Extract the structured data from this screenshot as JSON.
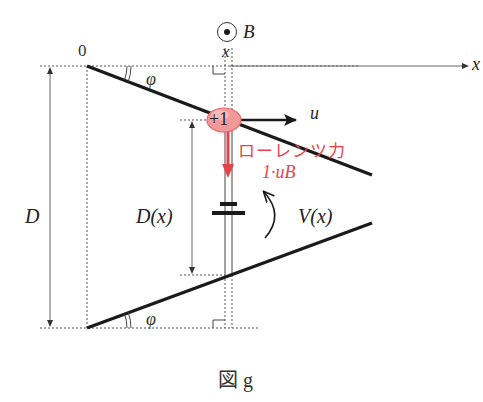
{
  "figure": {
    "caption": "図 g",
    "colors": {
      "line": "#1a1a1a",
      "dashed": "#555555",
      "charge_fill": "#f08a8a",
      "charge_stroke": "#e05a5a",
      "force": "#e8434a",
      "force_text": "#e8434a"
    }
  },
  "labels": {
    "origin": "0",
    "x_axis": "x",
    "x_position": "x",
    "magnetic_field": "B",
    "angle_top": "φ",
    "angle_bottom": "φ",
    "total_gap": "D",
    "local_gap": "D(x)",
    "voltage": "V(x)",
    "charge": "+1",
    "velocity": "u",
    "force_name": "ローレンツ力",
    "force_value": "1·uB"
  }
}
